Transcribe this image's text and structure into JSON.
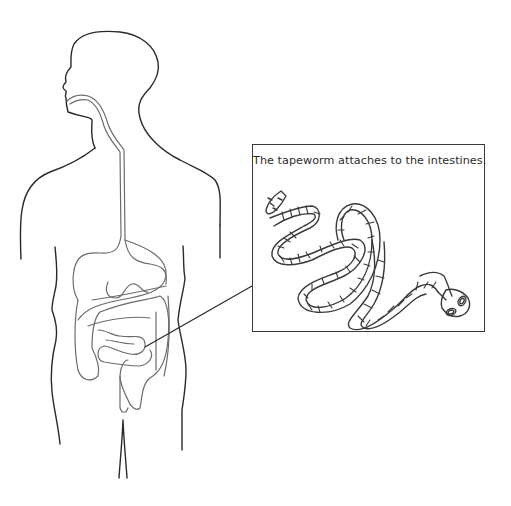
{
  "figure": {
    "type": "medical-illustration",
    "callout": {
      "text": "The tapeworm attaches to the intestines."
    },
    "labels": {
      "body": "human-body-outline",
      "digestive_tract": "esophagus-stomach-intestines",
      "pointer": "pointer-line-to-small-intestine",
      "tapeworm": "tapeworm-illustration",
      "tapeworm_head": "scolex-with-suckers"
    },
    "colors": {
      "body_stroke": "#2a2a2a",
      "organ_stroke": "#6b6b6b",
      "box_border": "#3a3a3a",
      "text": "#2b2b2b",
      "background": "#ffffff"
    }
  }
}
